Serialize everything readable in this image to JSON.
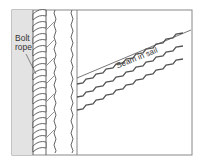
{
  "diagram": {
    "labels": {
      "bolt_rope_line1": "Bolt",
      "bolt_rope_line2": "rope",
      "seam": "Seam in sail"
    },
    "colors": {
      "edge_fill": "#e3e3e3",
      "stroke": "#555555",
      "frame": "#888888",
      "background": "#ffffff"
    }
  }
}
